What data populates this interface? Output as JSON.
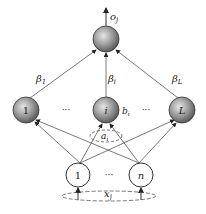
{
  "diagram": {
    "output": {
      "label": "o",
      "sub": "j"
    },
    "weights_out": [
      {
        "label": "β",
        "sub": "1"
      },
      {
        "label": "β",
        "sub": "i"
      },
      {
        "label": "β",
        "sub": "L"
      }
    ],
    "hidden_nodes": [
      {
        "label": "1"
      },
      {
        "label": "i"
      },
      {
        "label": "L"
      }
    ],
    "ellipsis": "···",
    "bias": {
      "label": "b",
      "sub": "i"
    },
    "input_weight": {
      "label": "a",
      "sub": "i"
    },
    "input_nodes": [
      {
        "label": "1"
      },
      {
        "label": "n"
      }
    ],
    "input": {
      "label": "x",
      "sub": "j"
    },
    "colors": {
      "hidden_fill": "#8c8c8c",
      "input_fill": "#ffffff",
      "stroke": "#333333"
    }
  }
}
